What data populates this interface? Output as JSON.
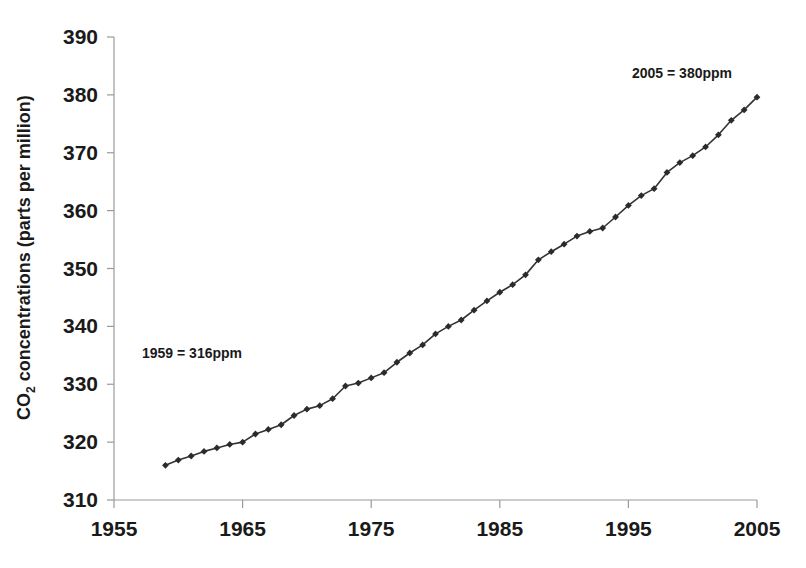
{
  "chart_data": {
    "type": "line",
    "title": "",
    "xlabel": "",
    "ylabel": "CO2 concentrations (parts per million)",
    "ylabel_parts": {
      "prefix": "CO",
      "subscript": "2",
      "suffix": " concentrations (parts per million)"
    },
    "xlim": [
      1955,
      2005
    ],
    "ylim": [
      310,
      390
    ],
    "xticks": [
      1955,
      1965,
      1975,
      1985,
      1995,
      2005
    ],
    "xtick_labels": [
      "1955",
      "1965",
      "1975",
      "1985",
      "1995",
      "2005"
    ],
    "yticks": [
      310,
      320,
      330,
      340,
      350,
      360,
      370,
      380,
      390
    ],
    "ytick_labels": [
      "310",
      "320",
      "330",
      "340",
      "350",
      "360",
      "370",
      "380",
      "390"
    ],
    "grid": false,
    "legend": false,
    "marker": "diamond",
    "line_color": "#333333",
    "marker_color": "#2b2b2b",
    "x": [
      1959,
      1960,
      1961,
      1962,
      1963,
      1964,
      1965,
      1966,
      1967,
      1968,
      1969,
      1970,
      1971,
      1972,
      1973,
      1974,
      1975,
      1976,
      1977,
      1978,
      1979,
      1980,
      1981,
      1982,
      1983,
      1984,
      1985,
      1986,
      1987,
      1988,
      1989,
      1990,
      1991,
      1992,
      1993,
      1994,
      1995,
      1996,
      1997,
      1998,
      1999,
      2000,
      2001,
      2002,
      2003,
      2004,
      2005
    ],
    "values": [
      316.0,
      316.9,
      317.6,
      318.4,
      319.0,
      319.6,
      320.0,
      321.4,
      322.2,
      323.0,
      324.6,
      325.7,
      326.3,
      327.5,
      329.7,
      330.2,
      331.1,
      332.0,
      333.8,
      335.4,
      336.8,
      338.7,
      340.0,
      341.1,
      342.8,
      344.4,
      345.9,
      347.2,
      348.9,
      351.5,
      352.9,
      354.2,
      355.6,
      356.4,
      357.0,
      358.9,
      360.9,
      362.6,
      363.8,
      366.6,
      368.3,
      369.5,
      371.0,
      373.1,
      375.6,
      377.4,
      379.6
    ],
    "annotations": [
      {
        "id": "start-annotation",
        "text": "1959 = 316ppm",
        "year": 1959,
        "value": 316
      },
      {
        "id": "end-annotation",
        "text": "2005 = 380ppm",
        "year": 2005,
        "value": 380
      }
    ]
  }
}
